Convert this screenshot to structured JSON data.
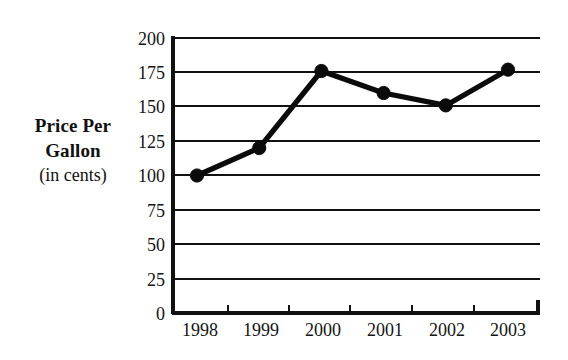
{
  "figure": {
    "y_axis_title_main": "Price Per Gallon",
    "y_axis_title_line1": "Price Per",
    "y_axis_title_line2": "Gallon",
    "y_axis_title_sub": "(in cents)"
  },
  "axis": {
    "y_ticks": [
      "0",
      "25",
      "50",
      "75",
      "100",
      "125",
      "150",
      "175",
      "200"
    ],
    "x_ticks": [
      "1998",
      "1999",
      "2000",
      "2001",
      "2002",
      "2003"
    ]
  },
  "chart_data": {
    "type": "line",
    "title": "",
    "subtitle": "",
    "xlabel": "",
    "ylabel": "Price Per Gallon (in cents)",
    "categories": [
      "1998",
      "1999",
      "2000",
      "2001",
      "2002",
      "2003"
    ],
    "x": [
      1998,
      1999,
      2000,
      2001,
      2002,
      2003
    ],
    "values": [
      100,
      120,
      176,
      160,
      151,
      177
    ],
    "series": [
      {
        "name": "Price Per Gallon",
        "values": [
          100,
          120,
          176,
          160,
          151,
          177
        ]
      }
    ],
    "ylim": [
      0,
      200
    ],
    "ytick_values": [
      0,
      25,
      50,
      75,
      100,
      125,
      150,
      175,
      200
    ],
    "ytick_labels": [
      "0",
      "25",
      "50",
      "75",
      "100",
      "125",
      "150",
      "175",
      "200"
    ],
    "xtick_labels": [
      "1998",
      "1999",
      "2000",
      "2001",
      "2002",
      "2003"
    ],
    "grid": "horizontal",
    "legend": "none",
    "marker": "filled-circle",
    "line_color": "#0b0b0b",
    "grid_color": "#111111",
    "background_color": "#ffffff"
  }
}
